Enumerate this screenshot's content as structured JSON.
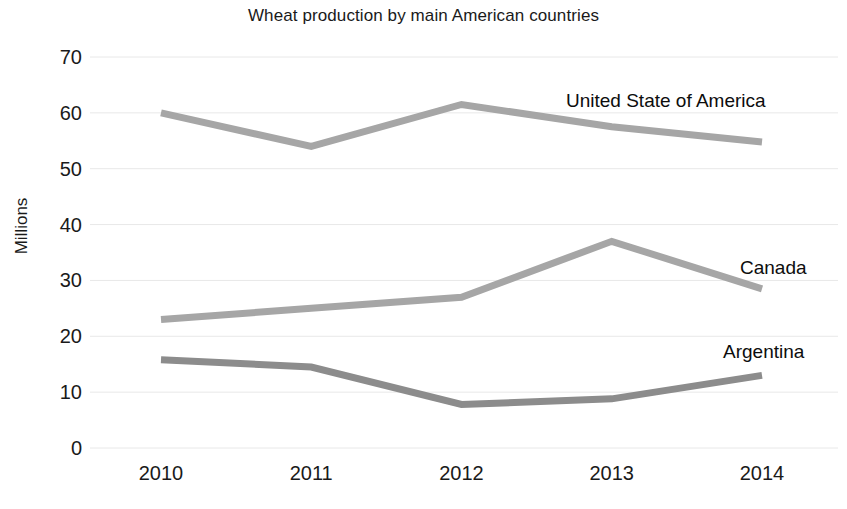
{
  "chart_data": {
    "type": "line",
    "title": "Wheat production by main American countries",
    "xlabel": "",
    "ylabel": "Millions",
    "categories": [
      "2010",
      "2011",
      "2012",
      "2013",
      "2014"
    ],
    "x": [
      2010,
      2011,
      2012,
      2013,
      2014
    ],
    "ylim": [
      0,
      70
    ],
    "yticks": [
      0,
      10,
      20,
      30,
      40,
      50,
      60,
      70
    ],
    "ytick_labels": [
      "0",
      "10",
      "20",
      "30",
      "40",
      "50",
      "60",
      "70"
    ],
    "grid": true,
    "grid_axis": "y",
    "legend_position": "inline-right-of-line-end",
    "series": [
      {
        "name": "United State of America",
        "values": [
          60.0,
          54.0,
          61.5,
          57.5,
          54.8
        ],
        "color": "#a6a6a6"
      },
      {
        "name": "Canada",
        "values": [
          23.0,
          25.0,
          27.0,
          37.0,
          28.5
        ],
        "color": "#a6a6a6"
      },
      {
        "name": "Argentina",
        "values": [
          15.8,
          14.5,
          7.8,
          8.8,
          13.0
        ],
        "color": "#8c8c8c"
      }
    ]
  },
  "style": {
    "background": "#ffffff",
    "text_color": "#1a1a1a",
    "gridline_color": "#e8e8e8",
    "line_width": 7
  }
}
